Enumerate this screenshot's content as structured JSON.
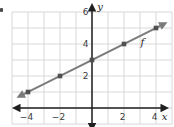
{
  "chart_data": {
    "type": "line",
    "title": "",
    "xlabel": "x",
    "ylabel": "y",
    "xlim": [
      -5,
      5
    ],
    "ylim": [
      -1,
      6
    ],
    "grid": true,
    "x_ticks": [
      {
        "pos": -4,
        "label": "−4"
      },
      {
        "pos": -2,
        "label": "−2"
      },
      {
        "pos": 2,
        "label": "2"
      },
      {
        "pos": 4,
        "label": "4"
      }
    ],
    "y_ticks": [
      {
        "pos": 2,
        "label": "2"
      },
      {
        "pos": 4,
        "label": "4"
      },
      {
        "pos": 6,
        "label": "6"
      }
    ],
    "series": [
      {
        "name": "f",
        "label": "f",
        "label_pos": [
          3.15,
          3.85
        ],
        "points": [
          [
            -4,
            1
          ],
          [
            -2,
            2
          ],
          [
            0,
            3
          ],
          [
            2,
            4
          ],
          [
            4,
            5
          ]
        ],
        "slope": 0.5,
        "y_intercept": 3,
        "line_extends_with_arrows": true
      }
    ]
  },
  "colors": {
    "background": "#ffffff",
    "grid": "#d8d8d8",
    "axis": "#1f1f1f",
    "line": "#7a7a7a",
    "point": "#4f4f4f",
    "tick_label": "#3a3a3a",
    "letter_label": "#1f1f1f"
  }
}
